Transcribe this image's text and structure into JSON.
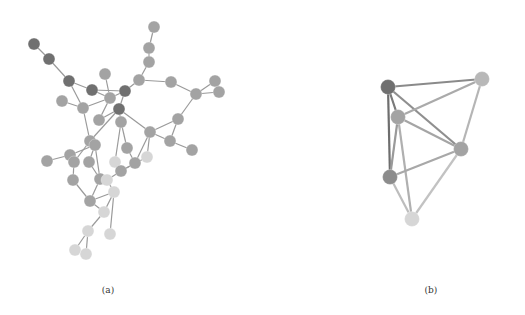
{
  "figure": {
    "panels": [
      {
        "id": "a",
        "caption": "(a)",
        "node_radius": 6,
        "edge_color": "#9a9a9a",
        "edge_width": 1.2,
        "nodes": [
          {
            "id": 1,
            "x": 34,
            "y": 44,
            "shade": "dark"
          },
          {
            "id": 2,
            "x": 49,
            "y": 59,
            "shade": "dark"
          },
          {
            "id": 3,
            "x": 69,
            "y": 81,
            "shade": "dark"
          },
          {
            "id": 4,
            "x": 92,
            "y": 90,
            "shade": "dark"
          },
          {
            "id": 5,
            "x": 105,
            "y": 74,
            "shade": "medium"
          },
          {
            "id": 6,
            "x": 110,
            "y": 98,
            "shade": "medium"
          },
          {
            "id": 7,
            "x": 125,
            "y": 91,
            "shade": "dark"
          },
          {
            "id": 8,
            "x": 139,
            "y": 80,
            "shade": "medium"
          },
          {
            "id": 9,
            "x": 154,
            "y": 27,
            "shade": "medium"
          },
          {
            "id": 10,
            "x": 149,
            "y": 48,
            "shade": "medium"
          },
          {
            "id": 11,
            "x": 149,
            "y": 62,
            "shade": "medium"
          },
          {
            "id": 12,
            "x": 171,
            "y": 82,
            "shade": "medium"
          },
          {
            "id": 13,
            "x": 196,
            "y": 94,
            "shade": "medium"
          },
          {
            "id": 14,
            "x": 215,
            "y": 81,
            "shade": "medium"
          },
          {
            "id": 15,
            "x": 219,
            "y": 92,
            "shade": "medium"
          },
          {
            "id": 16,
            "x": 62,
            "y": 101,
            "shade": "medium"
          },
          {
            "id": 17,
            "x": 83,
            "y": 108,
            "shade": "medium"
          },
          {
            "id": 18,
            "x": 119,
            "y": 109,
            "shade": "dark"
          },
          {
            "id": 19,
            "x": 99,
            "y": 120,
            "shade": "medium"
          },
          {
            "id": 20,
            "x": 121,
            "y": 122,
            "shade": "medium"
          },
          {
            "id": 21,
            "x": 150,
            "y": 132,
            "shade": "medium"
          },
          {
            "id": 22,
            "x": 178,
            "y": 119,
            "shade": "medium"
          },
          {
            "id": 23,
            "x": 170,
            "y": 141,
            "shade": "medium"
          },
          {
            "id": 24,
            "x": 192,
            "y": 150,
            "shade": "medium"
          },
          {
            "id": 25,
            "x": 90,
            "y": 141,
            "shade": "medium"
          },
          {
            "id": 26,
            "x": 95,
            "y": 145,
            "shade": "medium"
          },
          {
            "id": 27,
            "x": 127,
            "y": 148,
            "shade": "medium"
          },
          {
            "id": 28,
            "x": 47,
            "y": 161,
            "shade": "medium"
          },
          {
            "id": 29,
            "x": 70,
            "y": 155,
            "shade": "medium"
          },
          {
            "id": 30,
            "x": 74,
            "y": 162,
            "shade": "medium"
          },
          {
            "id": 31,
            "x": 89,
            "y": 162,
            "shade": "medium"
          },
          {
            "id": 32,
            "x": 115,
            "y": 162,
            "shade": "light"
          },
          {
            "id": 33,
            "x": 135,
            "y": 163,
            "shade": "medium"
          },
          {
            "id": 34,
            "x": 121,
            "y": 171,
            "shade": "medium"
          },
          {
            "id": 35,
            "x": 147,
            "y": 157,
            "shade": "light"
          },
          {
            "id": 36,
            "x": 73,
            "y": 180,
            "shade": "medium"
          },
          {
            "id": 37,
            "x": 100,
            "y": 179,
            "shade": "medium"
          },
          {
            "id": 38,
            "x": 107,
            "y": 180,
            "shade": "light"
          },
          {
            "id": 39,
            "x": 114,
            "y": 192,
            "shade": "light"
          },
          {
            "id": 40,
            "x": 90,
            "y": 201,
            "shade": "medium"
          },
          {
            "id": 41,
            "x": 104,
            "y": 212,
            "shade": "light"
          },
          {
            "id": 42,
            "x": 88,
            "y": 231,
            "shade": "light"
          },
          {
            "id": 43,
            "x": 110,
            "y": 234,
            "shade": "light"
          },
          {
            "id": 44,
            "x": 75,
            "y": 250,
            "shade": "light"
          },
          {
            "id": 45,
            "x": 86,
            "y": 254,
            "shade": "light"
          }
        ],
        "edges": [
          [
            1,
            2
          ],
          [
            2,
            3
          ],
          [
            3,
            4
          ],
          [
            4,
            6
          ],
          [
            3,
            17
          ],
          [
            4,
            7
          ],
          [
            5,
            6
          ],
          [
            6,
            7
          ],
          [
            6,
            17
          ],
          [
            7,
            8
          ],
          [
            7,
            18
          ],
          [
            8,
            11
          ],
          [
            10,
            11
          ],
          [
            9,
            10
          ],
          [
            8,
            12
          ],
          [
            12,
            13
          ],
          [
            13,
            14
          ],
          [
            13,
            15
          ],
          [
            14,
            15
          ],
          [
            16,
            17
          ],
          [
            17,
            25
          ],
          [
            6,
            19
          ],
          [
            18,
            19
          ],
          [
            18,
            20
          ],
          [
            18,
            21
          ],
          [
            13,
            22
          ],
          [
            21,
            22
          ],
          [
            22,
            23
          ],
          [
            21,
            23
          ],
          [
            23,
            24
          ],
          [
            18,
            25
          ],
          [
            20,
            27
          ],
          [
            21,
            35
          ],
          [
            25,
            26
          ],
          [
            26,
            29
          ],
          [
            28,
            29
          ],
          [
            29,
            30
          ],
          [
            26,
            31
          ],
          [
            30,
            36
          ],
          [
            26,
            37
          ],
          [
            31,
            37
          ],
          [
            27,
            33
          ],
          [
            33,
            34
          ],
          [
            32,
            34
          ],
          [
            37,
            40
          ],
          [
            36,
            40
          ],
          [
            37,
            38
          ],
          [
            34,
            38
          ],
          [
            38,
            39
          ],
          [
            39,
            40
          ],
          [
            39,
            41
          ],
          [
            40,
            41
          ],
          [
            41,
            42
          ],
          [
            39,
            43
          ],
          [
            42,
            44
          ],
          [
            42,
            45
          ],
          [
            21,
            33
          ],
          [
            25,
            30
          ],
          [
            20,
            32
          ],
          [
            35,
            34
          ]
        ]
      },
      {
        "id": "b",
        "caption": "(b)",
        "node_radius": 7.5,
        "edge_width": 2.2,
        "nodes": [
          {
            "id": "A",
            "x": 388,
            "y": 87,
            "shade": "dark"
          },
          {
            "id": "B",
            "x": 482,
            "y": 79,
            "shade": "medium-light"
          },
          {
            "id": "C",
            "x": 398,
            "y": 117,
            "shade": "medium"
          },
          {
            "id": "D",
            "x": 461,
            "y": 149,
            "shade": "medium"
          },
          {
            "id": "E",
            "x": 390,
            "y": 177,
            "shade": "medium-dark"
          },
          {
            "id": "F",
            "x": 412,
            "y": 219,
            "shade": "light"
          }
        ],
        "edges": [
          {
            "from": "A",
            "to": "B",
            "color": "#8a8a8a"
          },
          {
            "from": "A",
            "to": "C",
            "color": "#7a7a7a"
          },
          {
            "from": "A",
            "to": "D",
            "color": "#8f8f8f"
          },
          {
            "from": "A",
            "to": "E",
            "color": "#6e6e6e"
          },
          {
            "from": "B",
            "to": "C",
            "color": "#aaaaaa"
          },
          {
            "from": "B",
            "to": "D",
            "color": "#b5b5b5"
          },
          {
            "from": "C",
            "to": "D",
            "color": "#a5a5a5"
          },
          {
            "from": "C",
            "to": "E",
            "color": "#9a9a9a"
          },
          {
            "from": "C",
            "to": "F",
            "color": "#b0b0b0"
          },
          {
            "from": "D",
            "to": "E",
            "color": "#a8a8a8"
          },
          {
            "from": "D",
            "to": "F",
            "color": "#c2c2c2"
          },
          {
            "from": "E",
            "to": "F",
            "color": "#bdbdbd"
          }
        ]
      }
    ],
    "shades": {
      "dark": "#707070",
      "medium-dark": "#8c8c8c",
      "medium": "#a3a3a3",
      "medium-light": "#b8b8b8",
      "light": "#d6d6d6"
    }
  }
}
